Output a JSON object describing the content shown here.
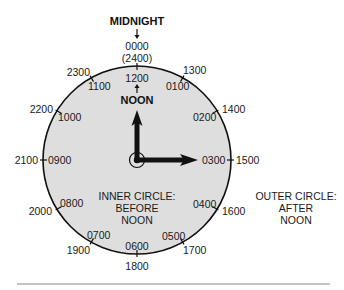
{
  "title": "MIDNIGHT",
  "top_values": {
    "main": "0000",
    "alt": "(2400)"
  },
  "noon_label": "NOON",
  "inner_top": "1200",
  "inner_circle_hours": [
    "1200",
    "0100",
    "0200",
    "0300",
    "0400",
    "0500",
    "0600",
    "0700",
    "0800",
    "0900",
    "1000",
    "1100"
  ],
  "outer_circle_hours": [
    "0000",
    "1300",
    "1400",
    "1500",
    "1600",
    "1700",
    "1800",
    "1900",
    "2000",
    "2100",
    "2200",
    "2300"
  ],
  "labels": {
    "inner": {
      "h01": "0100",
      "h02": "0200",
      "h03": "0300",
      "h04": "0400",
      "h05": "0500",
      "h06": "0600",
      "h07": "0700",
      "h08": "0800",
      "h09": "0900",
      "h10": "1000",
      "h11": "1100"
    },
    "outer": {
      "h13": "1300",
      "h14": "1400",
      "h15": "1500",
      "h16": "1600",
      "h17": "1700",
      "h18": "1800",
      "h19": "1900",
      "h20": "2000",
      "h21": "2100",
      "h22": "2200",
      "h23": "2300"
    }
  },
  "legend": {
    "inner": [
      "INNER CIRCLE:",
      "BEFORE",
      "NOON"
    ],
    "outer": [
      "OUTER CIRCLE:",
      "AFTER",
      "NOON"
    ]
  },
  "colors": {
    "dial_fill": "#dedede",
    "ink": "#111111",
    "rule": "#888888"
  }
}
